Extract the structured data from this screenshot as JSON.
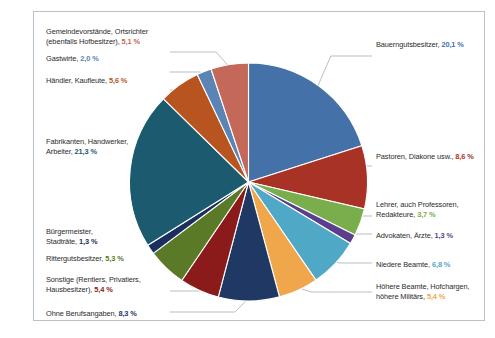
{
  "figure": {
    "background": "#ffffff",
    "frame_color": "#b9c0c6",
    "label_text_color": "#2b2b2b",
    "leader_line_color": "#9aa3ab",
    "slice_border_color": "#ffffff"
  },
  "chart_data": {
    "type": "pie",
    "title": "",
    "subtitle": "",
    "xlabel": "",
    "ylabel": "",
    "legend_position": "callout-labels",
    "grid": false,
    "unit": "%",
    "decimal_separator": ",",
    "total": 100.0,
    "start_angle_deg": 0,
    "direction": "clockwise",
    "categories": [
      "Bauerngutsbesitzer",
      "Pastoren, Diakone usw.",
      "Lehrer, auch Professoren, Redakteure",
      "Advokaten, Ärzte",
      "Niedere Beamte",
      "Höhere Beamte, Hofchargen, höhere Militärs",
      "Ohne Berufsangaben",
      "Sonstige (Rentiers, Privatiers, Hausbesitzer)",
      "Rittergutsbesitzer",
      "Bürgermeister, Stadträte",
      "Fabrikanten, Handwerker, Arbeiter",
      "Händler, Kaufleute",
      "Gastwirte",
      "Gemeindevorstände, Ortsrichter (ebenfalls Hofbesitzer)"
    ],
    "values": [
      20.1,
      8.6,
      3.7,
      1.3,
      6.8,
      5.4,
      8.3,
      5.4,
      5.3,
      1.3,
      21.3,
      5.6,
      2.0,
      5.1
    ],
    "value_labels": [
      "20,1 %",
      "8,6 %",
      "3,7 %",
      "1,3 %",
      "6,8 %",
      "5,4 %",
      "8,3 %",
      "5,4 %",
      "5,3 %",
      "1,3 %",
      "21,3 %",
      "5,6 %",
      "2,0 %",
      "5,1 %"
    ],
    "colors": [
      "#4472a8",
      "#a93226",
      "#7aad4c",
      "#5b3f8c",
      "#4fa8c5",
      "#f0a64b",
      "#1f3864",
      "#8b1a1a",
      "#5a7a28",
      "#1b2f5e",
      "#1c5a70",
      "#b85420",
      "#5b84b5",
      "#c4685a"
    ]
  },
  "labels": {
    "left": [
      {
        "line1": "Gemeindevorstände, Ortsrichter",
        "line2": "(ebenfalls Hofbesitzer),",
        "pct": "5,1  %",
        "color": "#c4685a"
      },
      {
        "line1": "Gastwirte,",
        "line2": "",
        "pct": "2,0 %",
        "color": "#5b84b5"
      },
      {
        "line1": "Händler, Kaufleute,",
        "line2": "",
        "pct": "5,6 %",
        "color": "#b85420"
      },
      {
        "line1": "Fabrikanten, Handwerker,",
        "line2": "Arbeiter,",
        "pct": "21,3 %",
        "color": "#1c5a70"
      },
      {
        "line1": "Bürgermeister,",
        "line2": "Stadträte,",
        "pct": "1,3 %",
        "color": "#1b2f5e"
      },
      {
        "line1": "Rittergutsbesitzer,",
        "line2": "",
        "pct": "5,3 %",
        "color": "#5a7a28"
      },
      {
        "line1": "Sonstige (Rentiers, Privatiers,",
        "line2": "Hausbesitzer),",
        "pct": "5,4 %",
        "color": "#8b1a1a"
      },
      {
        "line1": "Ohne Berufsangaben,",
        "line2": "",
        "pct": "8,3 %",
        "color": "#1f3864"
      }
    ],
    "right": [
      {
        "line1": "Bauerngutsbesitzer,",
        "line2": "",
        "pct": "20,1  %",
        "color": "#4472a8"
      },
      {
        "line1": "Pastoren, Diakone usw.,",
        "line2": "",
        "pct": "8,6 %",
        "color": "#a93226"
      },
      {
        "line1": "Lehrer, auch Professoren,",
        "line2": "Redakteure,",
        "pct": "3,7 %",
        "color": "#7aad4c"
      },
      {
        "line1": "Advokaten, Ärzte,",
        "line2": "",
        "pct": "1,3 %",
        "color": "#5b3f8c"
      },
      {
        "line1": "Niedere Beamte,",
        "line2": "",
        "pct": "6,8 %",
        "color": "#4fa8c5"
      },
      {
        "line1": "Höhere Beamte, Hofchargen,",
        "line2": "höhere Militärs,",
        "pct": "5,4 %",
        "color": "#f0a64b"
      }
    ]
  }
}
